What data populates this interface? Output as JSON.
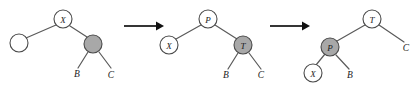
{
  "figure": {
    "stage_count": 3,
    "colors": {
      "node_fill_open": "#ffffff",
      "node_fill_highlight": "#a8a8a8",
      "node_stroke": "#4a4a4a",
      "edge": "#5a5a5a",
      "arrow": "#111111",
      "text": "#1a1a1a",
      "background": "#ffffff"
    }
  },
  "stages": [
    {
      "id": "stage-1",
      "nodes": [
        {
          "id": "s1-x",
          "label": "X",
          "shape": "circle",
          "fill": "open",
          "cx": 63,
          "cy": 19,
          "r": 9
        },
        {
          "id": "s1-empty",
          "label": "",
          "shape": "circle",
          "fill": "open",
          "cx": 19,
          "cy": 43,
          "r": 9
        },
        {
          "id": "s1-gray",
          "label": "",
          "shape": "circle",
          "fill": "highlight",
          "cx": 93,
          "cy": 44,
          "r": 9
        }
      ],
      "edges": [
        {
          "from": "s1-x",
          "to": "s1-empty"
        },
        {
          "from": "s1-x",
          "to": "s1-gray"
        },
        {
          "from": "s1-gray",
          "to": "s1-leaf-b"
        },
        {
          "from": "s1-gray",
          "to": "s1-leaf-c"
        }
      ],
      "leaves": [
        {
          "id": "s1-leaf-b",
          "label": "B",
          "x": 77,
          "y": 74
        },
        {
          "id": "s1-leaf-c",
          "label": "C",
          "x": 111,
          "y": 75
        }
      ]
    },
    {
      "id": "stage-2",
      "nodes": [
        {
          "id": "s2-p",
          "label": "P",
          "shape": "circle",
          "fill": "open",
          "cx": 208,
          "cy": 19,
          "r": 9
        },
        {
          "id": "s2-x",
          "label": "X",
          "shape": "circle",
          "fill": "open",
          "cx": 169,
          "cy": 45,
          "r": 9
        },
        {
          "id": "s2-gray",
          "label": "T",
          "shape": "circle",
          "fill": "highlight",
          "cx": 243,
          "cy": 45,
          "r": 9
        }
      ],
      "edges": [
        {
          "from": "s2-p",
          "to": "s2-x"
        },
        {
          "from": "s2-p",
          "to": "s2-gray"
        },
        {
          "from": "s2-gray",
          "to": "s2-leaf-b"
        },
        {
          "from": "s2-gray",
          "to": "s2-leaf-c"
        }
      ],
      "leaves": [
        {
          "id": "s2-leaf-b",
          "label": "B",
          "x": 226,
          "y": 75
        },
        {
          "id": "s2-leaf-c",
          "label": "C",
          "x": 261,
          "y": 75
        }
      ]
    },
    {
      "id": "stage-3",
      "nodes": [
        {
          "id": "s3-t",
          "label": "T",
          "shape": "circle",
          "fill": "open",
          "cx": 372,
          "cy": 19,
          "r": 9
        },
        {
          "id": "s3-gray",
          "label": "P",
          "shape": "circle",
          "fill": "highlight",
          "cx": 330,
          "cy": 47,
          "r": 9
        },
        {
          "id": "s3-x",
          "label": "X",
          "shape": "circle",
          "fill": "open",
          "cx": 313,
          "cy": 73,
          "r": 9
        }
      ],
      "edges": [
        {
          "from": "s3-t",
          "to": "s3-gray"
        },
        {
          "from": "s3-t",
          "to": "s3-leaf-c"
        },
        {
          "from": "s3-gray",
          "to": "s3-x"
        },
        {
          "from": "s3-gray",
          "to": "s3-leaf-b"
        }
      ],
      "leaves": [
        {
          "id": "s3-leaf-b",
          "label": "B",
          "x": 350,
          "y": 75
        },
        {
          "id": "s3-leaf-c",
          "label": "C",
          "x": 406,
          "y": 48
        }
      ]
    }
  ],
  "arrows": [
    {
      "id": "arrow-1",
      "x1": 124,
      "y1": 26,
      "x2": 164,
      "y2": 26
    },
    {
      "id": "arrow-2",
      "x1": 270,
      "y1": 26,
      "x2": 310,
      "y2": 26
    }
  ]
}
